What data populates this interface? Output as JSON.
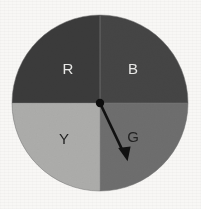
{
  "figure": {
    "kind": "probability-spinner",
    "background_color": "#f8f7f5"
  },
  "spinner": {
    "center_x": 100,
    "center_y": 103,
    "radius": 88,
    "divider_color": "#8d8d8d",
    "outline_color": "#6d6d6d",
    "sectors": [
      {
        "id": "sector-r",
        "label": "R",
        "name": "red",
        "start_angle": 180,
        "end_angle": 270,
        "position": "top-left",
        "fill": "#3b3b3b",
        "label_color": "#e8e8e6",
        "label_x": 68,
        "label_y": 70,
        "fraction": 0.25
      },
      {
        "id": "sector-b",
        "label": "B",
        "name": "blue",
        "start_angle": 270,
        "end_angle": 360,
        "position": "top-right",
        "fill": "#454545",
        "label_color": "#e8e8e6",
        "label_x": 133,
        "label_y": 70,
        "fraction": 0.25
      },
      {
        "id": "sector-y",
        "label": "Y",
        "name": "yellow",
        "start_angle": 90,
        "end_angle": 180,
        "position": "bottom-left",
        "fill": "#adadab",
        "label_color": "#232323",
        "label_x": 64,
        "label_y": 140,
        "fraction": 0.25
      },
      {
        "id": "sector-g",
        "label": "G",
        "name": "green",
        "start_angle": 0,
        "end_angle": 90,
        "position": "bottom-right",
        "fill": "#6e6e6e",
        "label_color": "#232323",
        "label_x": 133,
        "label_y": 138,
        "fraction": 0.25
      }
    ]
  },
  "pointer": {
    "id": "spinner-pointer",
    "color": "#111111",
    "pivot_x": 100,
    "pivot_y": 103,
    "tip_x": 127,
    "tip_y": 160,
    "hub_radius": 4.2,
    "shaft_width": 2.6,
    "points_to": "G",
    "heading_degrees": 64
  }
}
